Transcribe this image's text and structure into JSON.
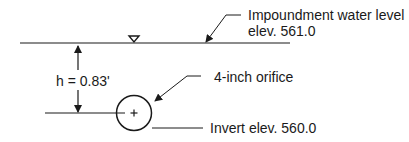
{
  "diagram": {
    "water_level": {
      "label_line1": "Impoundment water level",
      "label_line2": "elev. 561.0"
    },
    "head": {
      "label": "h = 0.83'"
    },
    "orifice": {
      "label": "4-inch orifice"
    },
    "invert": {
      "label": "Invert elev. 560.0"
    },
    "colors": {
      "line": "#1a1a1a",
      "background": "#ffffff"
    }
  }
}
